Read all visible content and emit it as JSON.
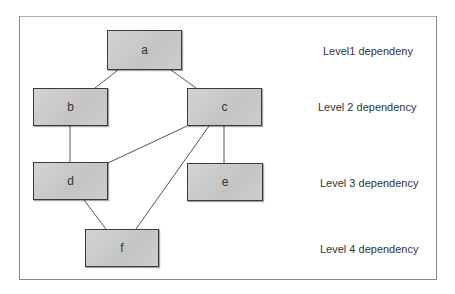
{
  "nodes": {
    "a": {
      "label": "a"
    },
    "b": {
      "label": "b"
    },
    "c": {
      "label": "c"
    },
    "d": {
      "label": "d"
    },
    "e": {
      "label": "e"
    },
    "f": {
      "label": "f"
    }
  },
  "edges": [
    {
      "from": "a",
      "to": "b"
    },
    {
      "from": "a",
      "to": "c"
    },
    {
      "from": "b",
      "to": "d"
    },
    {
      "from": "c",
      "to": "d"
    },
    {
      "from": "c",
      "to": "e"
    },
    {
      "from": "c",
      "to": "f"
    },
    {
      "from": "d",
      "to": "f"
    }
  ],
  "levels": [
    {
      "label": "Level1 dependeny"
    },
    {
      "label": "Level 2  dependency"
    },
    {
      "label": "Level 3 dependency"
    },
    {
      "label": "Level 4 dependency"
    }
  ]
}
